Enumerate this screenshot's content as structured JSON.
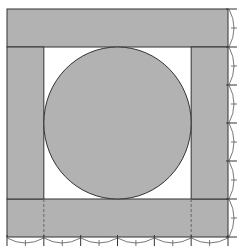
{
  "diagram": {
    "grid_divisions": 6,
    "colors": {
      "fill": "#b2b2b2",
      "stroke": "#333333",
      "background": "#ffffff",
      "arc_stroke": "#555555"
    },
    "shapes": [
      {
        "name": "top-band",
        "kind": "rectangle",
        "span_cols": [
          0,
          6
        ],
        "span_rows": [
          0,
          1
        ]
      },
      {
        "name": "bottom-band",
        "kind": "rectangle",
        "span_cols": [
          0,
          6
        ],
        "span_rows": [
          5,
          6
        ]
      },
      {
        "name": "left-band",
        "kind": "rectangle",
        "span_cols": [
          0,
          1
        ],
        "span_rows": [
          1,
          5
        ]
      },
      {
        "name": "right-band",
        "kind": "rectangle",
        "span_cols": [
          5,
          6
        ],
        "span_rows": [
          1,
          5
        ]
      },
      {
        "name": "inscribed-circle",
        "kind": "circle",
        "span_cols": [
          1,
          5
        ],
        "span_rows": [
          1,
          5
        ]
      }
    ],
    "dashed_guides": [
      {
        "name": "bottom-guide-left",
        "col": 1,
        "span_rows": [
          5,
          6
        ]
      },
      {
        "name": "bottom-guide-right",
        "col": 5,
        "span_rows": [
          5,
          6
        ]
      }
    ],
    "measure_marks": {
      "bottom_segments": 6,
      "right_segments": 6
    }
  }
}
